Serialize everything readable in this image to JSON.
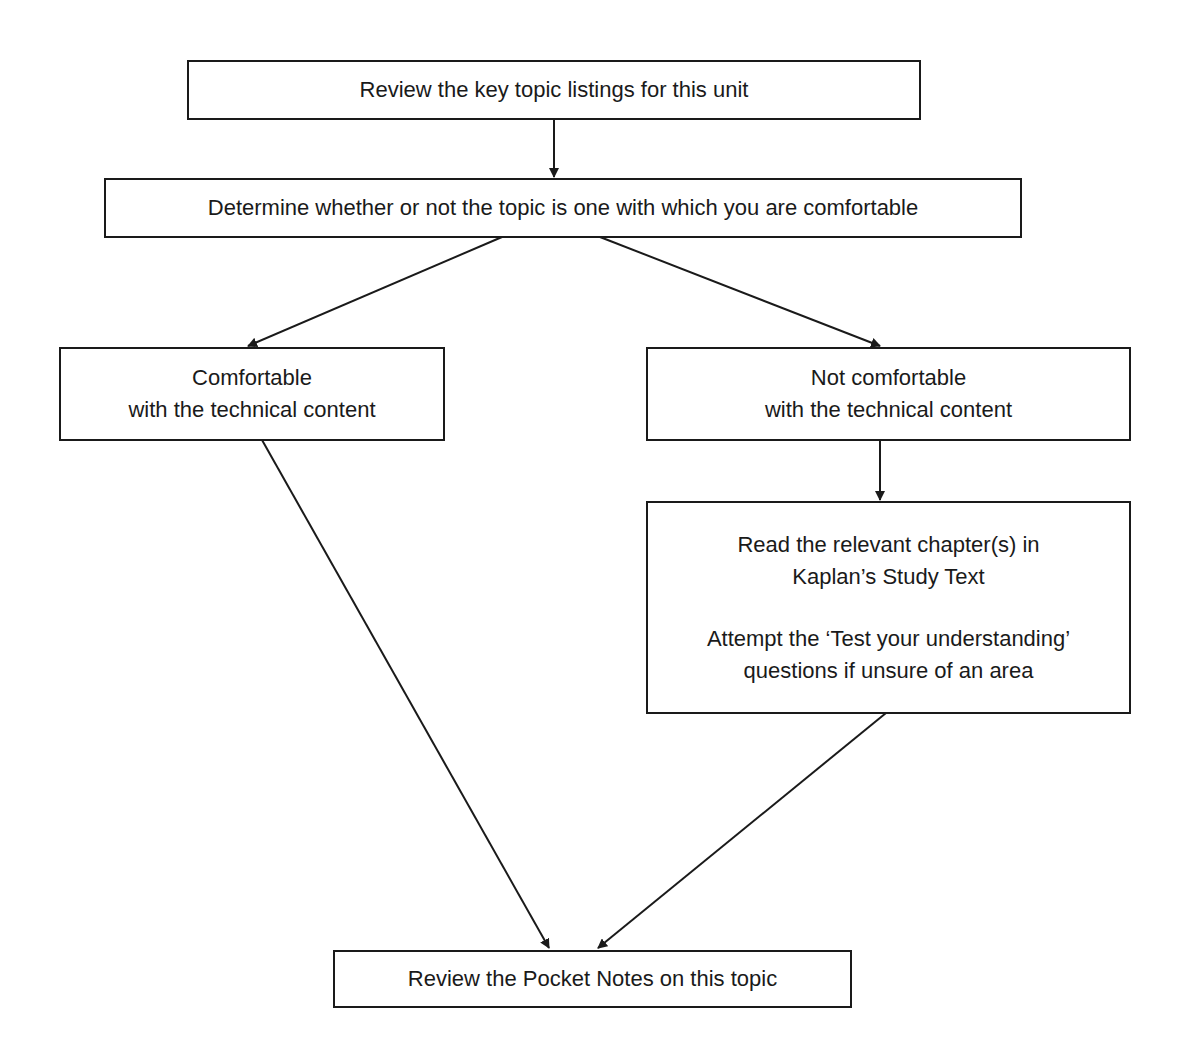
{
  "diagram": {
    "type": "flowchart",
    "nodes": [
      {
        "id": "review_topics",
        "lines": [
          "Review the key topic listings for this unit"
        ]
      },
      {
        "id": "determine",
        "lines": [
          "Determine whether or not the topic is one with which you are comfortable"
        ]
      },
      {
        "id": "comfortable",
        "lines": [
          "Comfortable",
          "with the technical content"
        ]
      },
      {
        "id": "not_comfortable",
        "lines": [
          "Not comfortable",
          "with the technical content"
        ]
      },
      {
        "id": "study",
        "paragraphs": [
          [
            "Read the relevant chapter(s) in",
            "Kaplan’s Study Text"
          ],
          [
            "Attempt the ‘Test your understanding’",
            "questions if unsure of an area"
          ]
        ]
      },
      {
        "id": "pocket_notes",
        "lines": [
          "Review the Pocket Notes on this topic"
        ]
      }
    ],
    "edges": [
      {
        "from": "review_topics",
        "to": "determine"
      },
      {
        "from": "determine",
        "to": "comfortable"
      },
      {
        "from": "determine",
        "to": "not_comfortable"
      },
      {
        "from": "not_comfortable",
        "to": "study"
      },
      {
        "from": "comfortable",
        "to": "pocket_notes"
      },
      {
        "from": "study",
        "to": "pocket_notes"
      }
    ]
  }
}
